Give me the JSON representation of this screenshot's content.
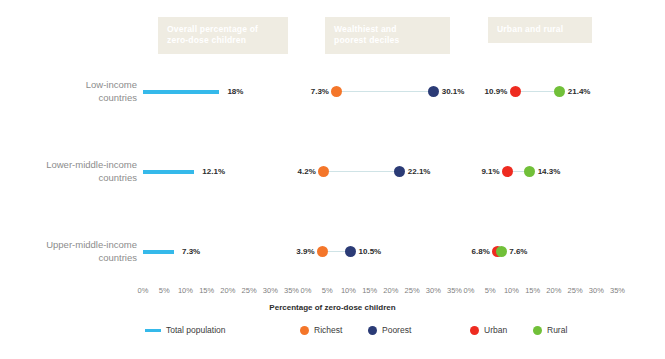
{
  "chart_data": {
    "type": "bar",
    "title": "",
    "xlabel": "Percentage of zero-dose children",
    "ylabel": "",
    "xlim": [
      0,
      37
    ],
    "grid": false,
    "legend_position": "bottom",
    "categories": [
      "Low-income countries",
      "Lower-middle-income countries",
      "Upper-middle-income countries"
    ],
    "tick_labels": [
      "0%",
      "5%",
      "10%",
      "15%",
      "20%",
      "25%",
      "30%",
      "35%"
    ],
    "tick_values": [
      0,
      5,
      10,
      15,
      20,
      25,
      30,
      35
    ],
    "panels": [
      {
        "id": "overall",
        "header": [
          "Overall percentage of",
          "zero-dose children"
        ],
        "type": "bar",
        "series": [
          {
            "name": "Total population",
            "color": "#35b9ea",
            "values": [
              18,
              12.1,
              7.3
            ],
            "labels": [
              "18%",
              "12.1%",
              "7.3%"
            ]
          }
        ]
      },
      {
        "id": "deciles",
        "header": [
          "Wealthiest and",
          "poorest deciles"
        ],
        "type": "dumbbell",
        "series": [
          {
            "name": "Richest",
            "color": "#f4762a",
            "values": [
              7.3,
              4.2,
              3.9
            ],
            "labels": [
              "7.3%",
              "4.2%",
              "3.9%"
            ]
          },
          {
            "name": "Poorest",
            "color": "#2b3b76",
            "values": [
              30.1,
              22.1,
              10.5
            ],
            "labels": [
              "30.1%",
              "22.1%",
              "10.5%"
            ]
          }
        ]
      },
      {
        "id": "urbanrural",
        "header": [
          "Urban and rural"
        ],
        "type": "dumbbell",
        "series": [
          {
            "name": "Urban",
            "color": "#ee2b20",
            "values": [
              10.9,
              9.1,
              6.8
            ],
            "labels": [
              "10.9%",
              "9.1%",
              "6.8%"
            ]
          },
          {
            "name": "Rural",
            "color": "#71c039",
            "values": [
              21.4,
              14.3,
              7.6
            ],
            "labels": [
              "21.4%",
              "14.3%",
              "7.6%"
            ]
          }
        ]
      }
    ]
  },
  "headers": {
    "overall_line1": "Overall percentage of",
    "overall_line2": "zero-dose children",
    "deciles_line1": "Wealthiest and",
    "deciles_line2": "poorest deciles",
    "urbanrural_line1": "Urban and rural"
  },
  "row_labels": [
    {
      "line1": "Low-income",
      "line2": "countries"
    },
    {
      "line1": "Lower-middle-income",
      "line2": "countries"
    },
    {
      "line1": "Upper-middle-income",
      "line2": "countries"
    }
  ],
  "axis": {
    "title": "Percentage of zero-dose children",
    "ticks": [
      "0%",
      "5%",
      "10%",
      "15%",
      "20%",
      "25%",
      "30%",
      "35%"
    ]
  },
  "legend": {
    "total_population": "Total population",
    "richest": "Richest",
    "poorest": "Poorest",
    "urban": "Urban",
    "rural": "Rural"
  },
  "values": {
    "overall": {
      "low": "18%",
      "lower_middle": "12.1%",
      "upper_middle": "7.3%"
    },
    "deciles": {
      "low_richest": "7.3%",
      "low_poorest": "30.1%",
      "lower_middle_richest": "4.2%",
      "lower_middle_poorest": "22.1%",
      "upper_middle_richest": "3.9%",
      "upper_middle_poorest": "10.5%"
    },
    "urbanrural": {
      "low_urban": "10.9%",
      "low_rural": "21.4%",
      "lower_middle_urban": "9.1%",
      "lower_middle_rural": "14.3%",
      "upper_middle_urban": "6.8%",
      "upper_middle_rural": "7.6%"
    }
  },
  "colors": {
    "total_population": "#35b9ea",
    "richest": "#f4762a",
    "poorest": "#2b3b76",
    "urban": "#ee2b20",
    "rural": "#71c039",
    "header_band": "#efece2"
  }
}
